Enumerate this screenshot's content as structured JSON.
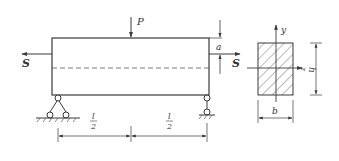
{
  "figure": {
    "type": "beam-cross-section-diagram",
    "beam": {
      "load_label": "P",
      "left_force_label": "S",
      "right_force_label": "S",
      "eccentricity_label": "a",
      "span_left_label_num": "l",
      "span_left_label_den": "2",
      "span_right_label_num": "l",
      "span_right_label_den": "2",
      "left_support": "fixed-pin-support",
      "right_support": "roller-support"
    },
    "cross_section": {
      "y_axis_label": "y",
      "z_axis_label": "z",
      "height_label": "h",
      "width_label": "b",
      "fill": "hatched"
    }
  },
  "colors": {
    "line": "#3a3a3a",
    "background": "#ffffff"
  }
}
